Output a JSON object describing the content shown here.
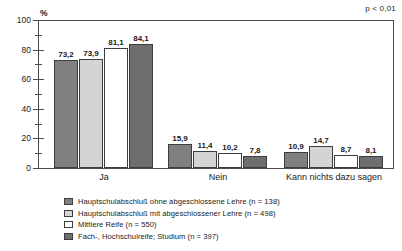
{
  "annotation": {
    "significance": "p < 0,01"
  },
  "axis": {
    "unit_label": "%",
    "y_ticks": [
      0,
      20,
      40,
      60,
      80,
      100
    ],
    "y_minor_ticks": [
      10,
      30,
      50,
      70,
      90
    ]
  },
  "legend": {
    "items": [
      {
        "label": "Hauptschulabschluß ohne abgeschlossene Lehre (n = 138)",
        "color": "#808080"
      },
      {
        "label": "Hauptschulabschluß mit abgeschlossener Lehre (n = 498)",
        "color": "#d4d4d4"
      },
      {
        "label": "Mittlere Reife (n = 550)",
        "color": "#ffffff"
      },
      {
        "label": "Fach-, Hochschulreife; Studium (n = 397)",
        "color": "#6e6e6e"
      }
    ]
  },
  "chart_data": {
    "type": "bar",
    "title": "",
    "subtitle": "",
    "xlabel": "",
    "ylabel": "%",
    "ylim": [
      0,
      100
    ],
    "grid": false,
    "legend_position": "bottom",
    "categories": [
      "Ja",
      "Nein",
      "Kann nichts dazu sagen"
    ],
    "series": [
      {
        "name": "Hauptschulabschluß ohne abgeschlossene Lehre (n = 138)",
        "color": "#808080",
        "values": [
          73.2,
          15.9,
          10.9
        ],
        "labels": [
          "73,2",
          "15,9",
          "10,9"
        ]
      },
      {
        "name": "Hauptschulabschluß mit abgeschlossener Lehre (n = 498)",
        "color": "#d4d4d4",
        "values": [
          73.9,
          11.4,
          14.7
        ],
        "labels": [
          "73,9",
          "11,4",
          "14,7"
        ]
      },
      {
        "name": "Mittlere Reife (n = 550)",
        "color": "#ffffff",
        "values": [
          81.1,
          10.2,
          8.7
        ],
        "labels": [
          "81,1",
          "10,2",
          "8,7"
        ]
      },
      {
        "name": "Fach-, Hochschulreife; Studium (n = 397)",
        "color": "#6e6e6e",
        "values": [
          84.1,
          7.8,
          8.1
        ],
        "labels": [
          "84,1",
          "7,8",
          "8,1"
        ]
      }
    ],
    "annotations": [
      "p < 0,01"
    ]
  }
}
